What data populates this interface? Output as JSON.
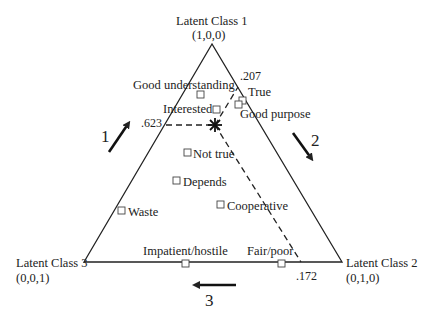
{
  "diagram": {
    "type": "ternary-latent-class-plot",
    "vertices": [
      {
        "id": "class1",
        "label": "Latent Class 1",
        "coords": "(1,0,0)"
      },
      {
        "id": "class2",
        "label": "Latent Class 2",
        "coords": "(0,1,0)"
      },
      {
        "id": "class3",
        "label": "Latent Class 3",
        "coords": "(0,0,1)"
      }
    ],
    "axis_arrows": [
      {
        "id": "arrow1",
        "label": "1"
      },
      {
        "id": "arrow2",
        "label": "2"
      },
      {
        "id": "arrow3",
        "label": "3"
      }
    ],
    "reference_point": {
      "marker": "star",
      "values": [
        ".623",
        ".207",
        ".172"
      ]
    },
    "points": [
      {
        "label": "Good understanding"
      },
      {
        "label": "Interested"
      },
      {
        "label": "True"
      },
      {
        "label": "Good purpose"
      },
      {
        "label": "Not true"
      },
      {
        "label": "Depends"
      },
      {
        "label": "Waste"
      },
      {
        "label": "Cooperative"
      },
      {
        "label": "Impatient/hostile"
      },
      {
        "label": "Fair/poor"
      }
    ],
    "colors": {
      "line": "#222222",
      "background": "#ffffff"
    }
  }
}
